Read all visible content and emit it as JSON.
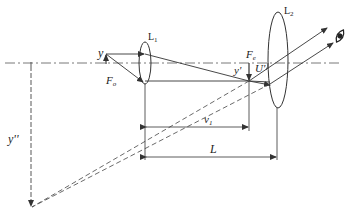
{
  "diagram": {
    "type": "optical-ray-diagram",
    "labels": {
      "objective_lens": "L",
      "objective_lens_sub": "1",
      "eyepiece_lens": "L",
      "eyepiece_lens_sub": "2",
      "object": "y",
      "object_focus": "F",
      "object_focus_sub": "o",
      "eyepiece_focus": "F",
      "eyepiece_focus_sub": "e",
      "intermediate_image": "y'",
      "angle": "U'",
      "final_image": "y''",
      "image_distance": "v",
      "image_distance_sub": "1",
      "lens_separation": "L"
    },
    "elements": [
      {
        "id": "optical-axis",
        "style": "dash-dot"
      },
      {
        "id": "lens-L1",
        "kind": "converging lens",
        "position": "left"
      },
      {
        "id": "lens-L2",
        "kind": "converging lens",
        "position": "right"
      },
      {
        "id": "object-arrow",
        "label": "y"
      },
      {
        "id": "intermediate-image-arrow",
        "label": "y'"
      },
      {
        "id": "virtual-image-arrow",
        "label": "y''",
        "style": "dashed"
      },
      {
        "id": "eye-icon",
        "position": "top-right"
      },
      {
        "id": "dimension-v1",
        "from": "L1",
        "to": "intermediate image"
      },
      {
        "id": "dimension-L",
        "from": "L1",
        "to": "L2"
      }
    ],
    "colors": {
      "line": "#333333",
      "background": "#ffffff"
    }
  }
}
